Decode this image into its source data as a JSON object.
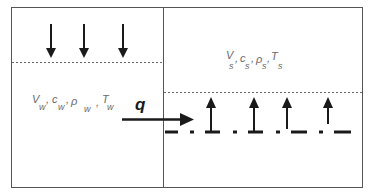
{
  "diagram": {
    "left_region": {
      "label_parts": [
        {
          "sym": "V",
          "sub": "w"
        },
        {
          "sym": "c",
          "sub": "w"
        },
        {
          "sym": "ρ",
          "sub": "w"
        },
        {
          "sym": "T",
          "sub": "w"
        }
      ],
      "arrows_direction": "down",
      "arrow_count": 3
    },
    "right_region": {
      "label_parts": [
        {
          "sym": "V",
          "sub": "s"
        },
        {
          "sym": "c",
          "sub": "s"
        },
        {
          "sym": "ρ",
          "sub": "s"
        },
        {
          "sym": "T",
          "sub": "s"
        }
      ],
      "arrows_direction": "up",
      "arrow_count": 4
    },
    "flux_label": "q",
    "separator": ","
  }
}
